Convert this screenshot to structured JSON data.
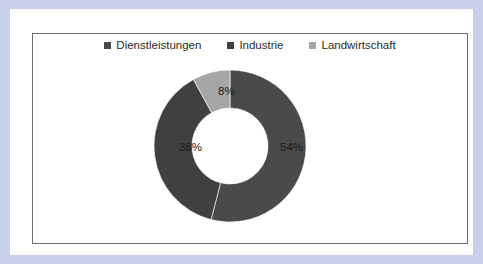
{
  "colors": {
    "page_border": "#c7d0e8",
    "sheet": "#ffffff",
    "frame_border": "#6e6e6e",
    "series_dark": "#4a4a4a",
    "series_dark2": "#404040",
    "series_light": "#a6a6a6",
    "label_text": "#1a1a1a"
  },
  "legend": {
    "position": "top",
    "items": [
      {
        "label": "Dienstleistungen",
        "color": "#4a4a4a",
        "marker": "square-marker"
      },
      {
        "label": "Industrie",
        "color": "#404040",
        "marker": "square-marker"
      },
      {
        "label": "Landwirtschaft",
        "color": "#a6a6a6",
        "marker": "square-marker"
      }
    ]
  },
  "chart_data": {
    "type": "pie",
    "variant": "doughnut",
    "title": "",
    "categories": [
      "Dienstleistungen",
      "Industrie",
      "Landwirtschaft"
    ],
    "values": [
      54,
      38,
      8
    ],
    "unit": "%",
    "data_labels": [
      "54%",
      "38%",
      "8%"
    ],
    "colors": [
      "#4a4a4a",
      "#404040",
      "#a6a6a6"
    ],
    "start_angle": 0,
    "direction": "clockwise",
    "hole_ratio": 0.5,
    "legend": "top",
    "grid": false
  }
}
